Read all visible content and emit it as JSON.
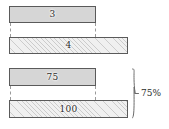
{
  "figure": {
    "title": "",
    "background_color": "#ffffff",
    "bar_fill_solid": "#d6d6d6",
    "bar_fill_hatched": "#f0f0f0",
    "bar_border_color": "#5a5a5a",
    "connector_color": "#9a9a9a",
    "text_color": "#2b2b2b"
  },
  "groups": [
    {
      "id": "group-top",
      "bars": [
        {
          "id": "bar-3",
          "label": "3",
          "style": "solid",
          "x": 9,
          "y": 6,
          "width": 87,
          "height": 17
        },
        {
          "id": "bar-4",
          "label": "4",
          "style": "hatched",
          "x": 9,
          "y": 37,
          "width": 119,
          "height": 17
        }
      ],
      "connectors": [
        {
          "x": 10,
          "y": 23,
          "height": 14
        },
        {
          "x": 95,
          "y": 23,
          "height": 14
        }
      ]
    },
    {
      "id": "group-bottom",
      "bars": [
        {
          "id": "bar-75",
          "label": "75",
          "style": "solid",
          "x": 9,
          "y": 68,
          "width": 87,
          "height": 18
        },
        {
          "id": "bar-100",
          "label": "100",
          "style": "hatched",
          "x": 9,
          "y": 100,
          "width": 119,
          "height": 18
        }
      ],
      "connectors": [
        {
          "x": 10,
          "y": 86,
          "height": 14
        },
        {
          "x": 95,
          "y": 86,
          "height": 14
        }
      ]
    }
  ],
  "annotation": {
    "id": "brace-75-percent",
    "label": "75%",
    "x": 131,
    "y": 68,
    "height": 51
  },
  "chart_data": {
    "type": "bar",
    "title": "",
    "xlabel": "",
    "ylabel": "",
    "orientation": "horizontal",
    "grid": false,
    "legend": null,
    "categories": [
      "3",
      "4",
      "75",
      "100"
    ],
    "values": [
      3,
      4,
      75,
      100
    ],
    "series": [
      {
        "name": "comparison-pair-1",
        "bars": [
          {
            "label": "3",
            "value": 3,
            "fill": "solid"
          },
          {
            "label": "4",
            "value": 4,
            "fill": "hatched"
          }
        ]
      },
      {
        "name": "comparison-pair-2",
        "bars": [
          {
            "label": "75",
            "value": 75,
            "fill": "solid"
          },
          {
            "label": "100",
            "value": 100,
            "fill": "hatched"
          }
        ]
      }
    ],
    "annotations": [
      {
        "text": "75%",
        "targets": [
          "75",
          "100"
        ],
        "kind": "brace"
      }
    ]
  }
}
